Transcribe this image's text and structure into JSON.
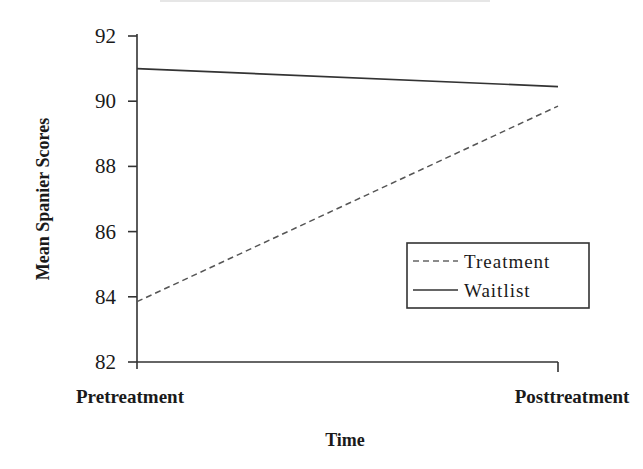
{
  "chart_data": {
    "type": "line",
    "title": "",
    "xlabel": "Time",
    "ylabel": "Mean Spanier Scores",
    "categories": [
      "Pretreatment",
      "Posttreatment"
    ],
    "series": [
      {
        "name": "Treatment",
        "values": [
          83.85,
          89.85
        ],
        "line_style": "dashed",
        "color": "#555555"
      },
      {
        "name": "Waitlist",
        "values": [
          91.0,
          90.45
        ],
        "line_style": "solid",
        "color": "#333333"
      }
    ],
    "ylim": [
      82,
      92
    ],
    "yticks": [
      82,
      84,
      86,
      88,
      90,
      92
    ],
    "grid": false,
    "legend_position": "lower right (inside plot)"
  },
  "axes": {
    "ylabel": "Mean Spanier Scores",
    "xlabel": "Time",
    "yticks": [
      "82",
      "84",
      "86",
      "88",
      "90",
      "92"
    ],
    "xticks": [
      "Pretreatment",
      "Posttreatment"
    ]
  },
  "legend": {
    "items": [
      {
        "label": "Treatment",
        "style": "dashed"
      },
      {
        "label": "Waitlist",
        "style": "solid"
      }
    ]
  }
}
